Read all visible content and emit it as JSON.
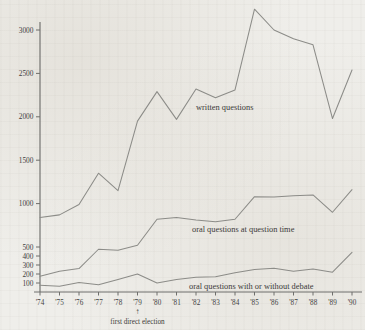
{
  "chart_data": {
    "type": "line",
    "title": "",
    "subtitle": "",
    "xlabel": "",
    "ylabel": "",
    "grid": false,
    "legend_position": "inline-labels",
    "y_axis": {
      "scale": "piecewise-compressed",
      "ticks": [
        100,
        200,
        300,
        400,
        500,
        1000,
        1500,
        2000,
        2500,
        3000
      ],
      "tick_labels": [
        "100",
        "200",
        "300",
        "400",
        "500",
        "1000",
        "1500",
        "2000",
        "2500",
        "3000"
      ],
      "ylim": [
        0,
        3300
      ]
    },
    "x_axis": {
      "categories": [
        "'74",
        "'75",
        "'76",
        "'77",
        "'78",
        "'79",
        "'80",
        "'81",
        "'82",
        "'83",
        "'84",
        "'85",
        "'86",
        "'87",
        "'88",
        "'89",
        "'90"
      ],
      "values": [
        1974,
        1975,
        1976,
        1977,
        1978,
        1979,
        1980,
        1981,
        1982,
        1983,
        1984,
        1985,
        1986,
        1987,
        1988,
        1989,
        1990
      ]
    },
    "annotations": [
      {
        "name": "first-direct-election",
        "text": "first direct election",
        "arrow": "↑",
        "at_category": "'79"
      }
    ],
    "series": [
      {
        "name": "written questions",
        "label": "written questions",
        "color": "#8c8c88",
        "values": [
          840,
          870,
          990,
          1350,
          1150,
          1950,
          2290,
          1970,
          2320,
          2220,
          2310,
          3240,
          3000,
          2900,
          2830,
          1980,
          2540
        ]
      },
      {
        "name": "oral questions at question time",
        "label": "oral questions at question time",
        "color": "#8c8c88",
        "values": [
          175,
          230,
          260,
          475,
          465,
          520,
          820,
          840,
          810,
          790,
          820,
          1080,
          1075,
          1090,
          1100,
          900,
          1160
        ]
      },
      {
        "name": "oral questions with or without debate",
        "label": "oral questions with or without debate",
        "color": "#8c8c88",
        "values": [
          75,
          65,
          105,
          80,
          140,
          200,
          100,
          140,
          165,
          170,
          215,
          250,
          265,
          230,
          255,
          220,
          440
        ]
      }
    ]
  },
  "series_label_positions": [
    {
      "x": 196,
      "y": 110
    },
    {
      "x": 192,
      "y": 232
    },
    {
      "x": 189,
      "y": 289
    }
  ],
  "colors": {
    "background": "#efeeea",
    "axis": "#6f6f6c",
    "line": "#8c8c88",
    "text": "#3a3a38"
  }
}
